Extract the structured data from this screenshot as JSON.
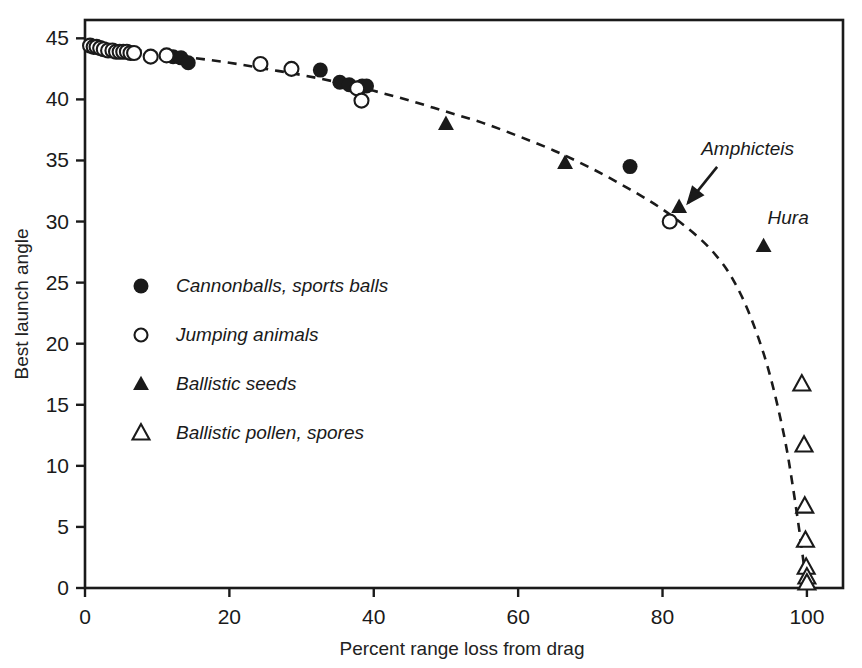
{
  "chart_data": {
    "type": "scatter",
    "title": "",
    "xlabel": "Percent range loss from drag",
    "ylabel": "Best launch angle",
    "xlim": [
      0,
      105
    ],
    "ylim": [
      0,
      46.5
    ],
    "xticks": [
      0,
      20,
      40,
      60,
      80,
      100
    ],
    "yticks": [
      0,
      5,
      10,
      15,
      20,
      25,
      30,
      35,
      40,
      45
    ],
    "grid": false,
    "legend_position": "inner-left",
    "series": [
      {
        "name": "Cannonballs, sports balls",
        "marker": "filled-circle",
        "points": [
          [
            12.2,
            43.5
          ],
          [
            13.3,
            43.4
          ],
          [
            14.3,
            43.0
          ],
          [
            32.6,
            42.4
          ],
          [
            35.3,
            41.4
          ],
          [
            36.6,
            41.2
          ],
          [
            38.4,
            41.1
          ],
          [
            39.0,
            41.1
          ],
          [
            75.5,
            34.5
          ]
        ]
      },
      {
        "name": "Jumping animals",
        "marker": "open-circle",
        "points": [
          [
            0.7,
            44.4
          ],
          [
            1.2,
            44.3
          ],
          [
            1.6,
            44.3
          ],
          [
            2.1,
            44.2
          ],
          [
            2.6,
            44.1
          ],
          [
            3.2,
            44.0
          ],
          [
            3.8,
            44.0
          ],
          [
            4.3,
            43.9
          ],
          [
            4.8,
            43.9
          ],
          [
            5.3,
            43.9
          ],
          [
            5.8,
            43.9
          ],
          [
            6.3,
            43.8
          ],
          [
            6.8,
            43.8
          ],
          [
            9.1,
            43.5
          ],
          [
            11.3,
            43.6
          ],
          [
            24.3,
            42.9
          ],
          [
            28.6,
            42.5
          ],
          [
            37.7,
            40.9
          ],
          [
            38.3,
            39.9
          ],
          [
            81.0,
            30.0
          ]
        ]
      },
      {
        "name": "Ballistic seeds",
        "marker": "filled-triangle",
        "points": [
          [
            50.0,
            38.0
          ],
          [
            66.5,
            34.8
          ],
          [
            82.3,
            31.2
          ],
          [
            94.0,
            28.0
          ]
        ]
      },
      {
        "name": "Ballistic pollen, spores",
        "marker": "open-triangle",
        "points": [
          [
            99.3,
            16.7
          ],
          [
            99.6,
            11.7
          ],
          [
            99.7,
            6.7
          ],
          [
            99.8,
            3.9
          ],
          [
            99.9,
            1.7
          ],
          [
            100.0,
            0.9
          ],
          [
            100.0,
            0.4
          ]
        ]
      }
    ],
    "trend_curve": {
      "style": "dashed",
      "points": [
        [
          0,
          44.6
        ],
        [
          5,
          44.2
        ],
        [
          10,
          43.8
        ],
        [
          15,
          43.4
        ],
        [
          20,
          43.0
        ],
        [
          25,
          42.5
        ],
        [
          30,
          42.0
        ],
        [
          35,
          41.4
        ],
        [
          40,
          40.7
        ],
        [
          45,
          39.9
        ],
        [
          50,
          39.0
        ],
        [
          55,
          38.1
        ],
        [
          60,
          37.0
        ],
        [
          65,
          35.8
        ],
        [
          70,
          34.4
        ],
        [
          75,
          32.8
        ],
        [
          80,
          31.0
        ],
        [
          85,
          28.7
        ],
        [
          88,
          26.8
        ],
        [
          90,
          25.0
        ],
        [
          92,
          22.5
        ],
        [
          94,
          19.2
        ],
        [
          95.5,
          16.0
        ],
        [
          97,
          12.0
        ],
        [
          98,
          8.5
        ],
        [
          99,
          4.5
        ],
        [
          99.6,
          1.8
        ],
        [
          100,
          0
        ]
      ]
    },
    "annotations": [
      {
        "text": "Amphicteis",
        "kind": "arrow-label",
        "target": [
          82.3,
          31.2
        ]
      },
      {
        "text": "Hura",
        "kind": "label",
        "target": [
          94.0,
          28.0
        ]
      }
    ]
  },
  "legend": {
    "items": [
      {
        "label": "Cannonballs, sports balls",
        "marker": "filled-circle"
      },
      {
        "label": "Jumping animals",
        "marker": "open-circle"
      },
      {
        "label": "Ballistic seeds",
        "marker": "filled-triangle"
      },
      {
        "label": "Ballistic pollen, spores",
        "marker": "open-triangle"
      }
    ]
  },
  "axes": {
    "x_title": "Percent range loss from drag",
    "y_title": "Best launch angle",
    "x_tick_labels": [
      "0",
      "20",
      "40",
      "60",
      "80",
      "100"
    ],
    "y_tick_labels": [
      "0",
      "5",
      "10",
      "15",
      "20",
      "25",
      "30",
      "35",
      "40",
      "45"
    ]
  },
  "colors": {
    "ink": "#1a1a1a",
    "background": "#ffffff"
  }
}
